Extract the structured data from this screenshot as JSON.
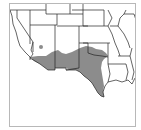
{
  "map": {
    "type": "species-range-map",
    "region": "Southwestern United States",
    "colors": {
      "range_fill": "#8c8c8c",
      "state_lines": "#222222",
      "frame": "#b8b8b8",
      "background": "#ffffff"
    },
    "layers": [
      "state-boundaries",
      "range-shading",
      "isolated-population-dot"
    ]
  }
}
